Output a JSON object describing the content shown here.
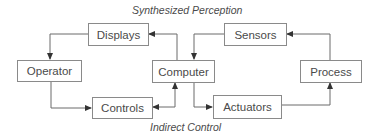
{
  "diagram": {
    "top_caption": "Synthesized Perception",
    "bottom_caption": "Indirect Control",
    "nodes": {
      "displays": "Displays",
      "sensors": "Sensors",
      "operator": "Operator",
      "computer": "Computer",
      "process": "Process",
      "controls": "Controls",
      "actuators": "Actuators"
    },
    "edges": [
      {
        "from": "Computer",
        "to": "Displays"
      },
      {
        "from": "Displays",
        "to": "Operator"
      },
      {
        "from": "Operator",
        "to": "Controls"
      },
      {
        "from": "Controls",
        "to": "Computer",
        "bidirectional": true
      },
      {
        "from": "Computer",
        "to": "Actuators"
      },
      {
        "from": "Actuators",
        "to": "Process"
      },
      {
        "from": "Process",
        "to": "Sensors"
      },
      {
        "from": "Sensors",
        "to": "Computer"
      }
    ],
    "colors": {
      "line": "#6a6a6a",
      "box_border": "#8a8a8a",
      "text": "#4a4a4a"
    }
  }
}
